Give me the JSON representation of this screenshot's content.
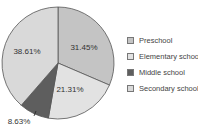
{
  "chart_data": {
    "type": "pie",
    "title": "",
    "categories": [
      "Preschool",
      "Elementary school",
      "Middle school",
      "Secondary school"
    ],
    "values": [
      31.45,
      21.31,
      8.63,
      38.61
    ],
    "labels": [
      "31.45%",
      "21.31%",
      "8.63%",
      "38.61%"
    ],
    "colors": [
      "#c4c4c4",
      "#e2e2e2",
      "#5e5e5e",
      "#d9d9d9"
    ],
    "start_angle": "12 o'clock",
    "direction": "clockwise",
    "legend_position": "right"
  },
  "legend": {
    "items": [
      {
        "label": "Preschool",
        "color": "#c4c4c4"
      },
      {
        "label": "Elementary school",
        "color": "#e2e2e2"
      },
      {
        "label": "Middle school",
        "color": "#5e5e5e"
      },
      {
        "label": "Secondary school",
        "color": "#d9d9d9"
      }
    ]
  }
}
